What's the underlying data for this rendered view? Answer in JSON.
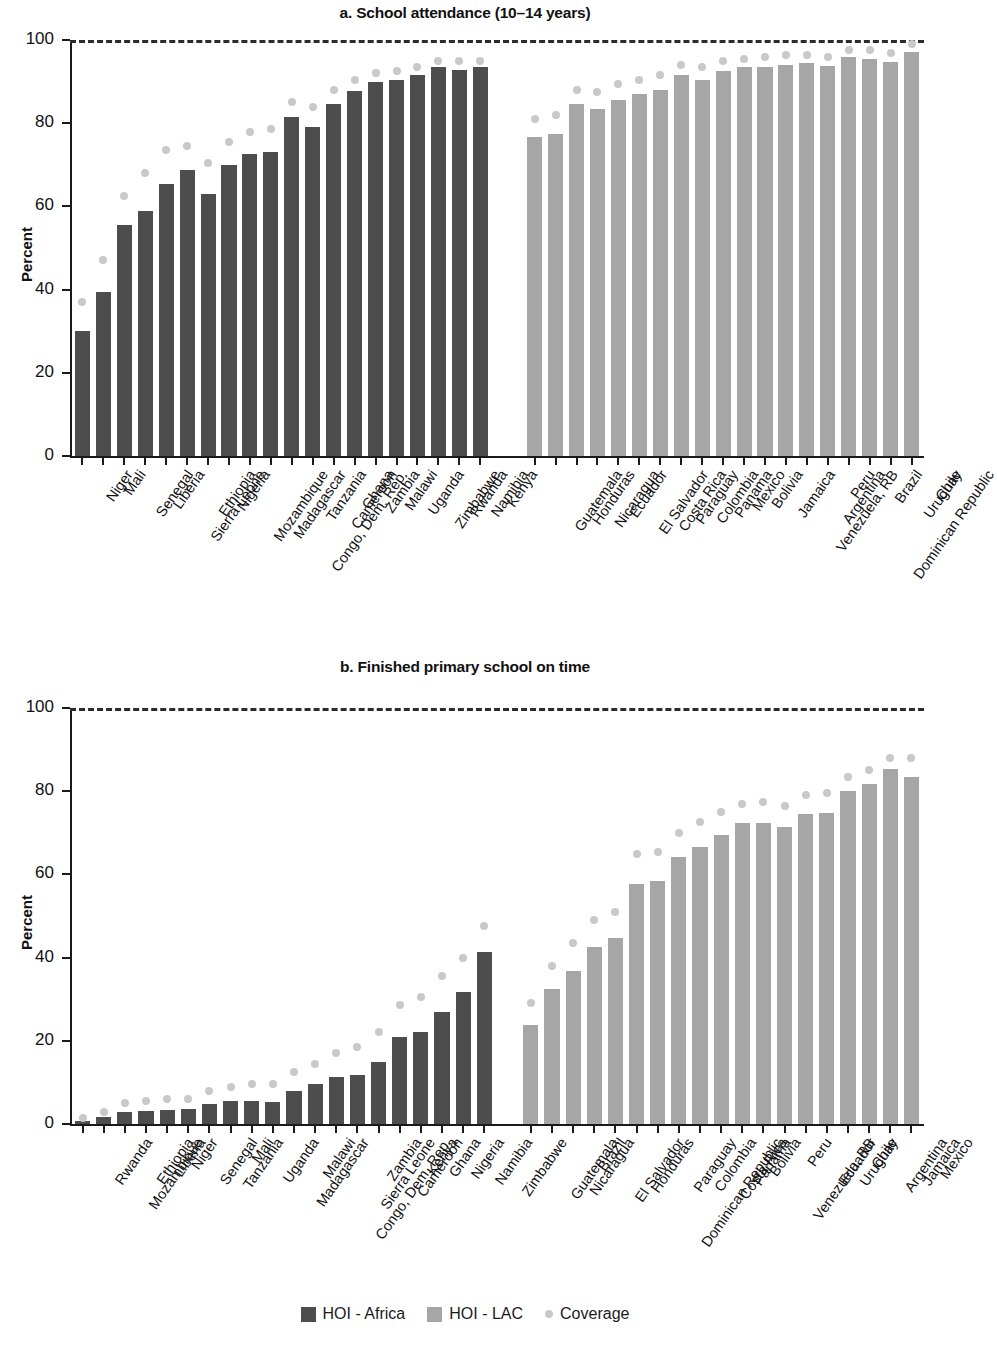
{
  "figure": {
    "ylabel": "Percent",
    "legend": [
      {
        "label": "HOI - Africa",
        "type": "bar",
        "color": "#4d4d4d"
      },
      {
        "label": "HOI - LAC",
        "type": "bar",
        "color": "#a6a6a6"
      },
      {
        "label": "Coverage",
        "type": "dot",
        "color": "#c9c9c9"
      }
    ]
  },
  "chart_data": [
    {
      "type": "bar",
      "id": "a",
      "title": "a. School attendance (10–14 years)",
      "xlabel": "",
      "ylabel": "Percent",
      "ylim": [
        0,
        100
      ],
      "yticks": [
        0,
        20,
        40,
        60,
        80,
        100
      ],
      "grid": false,
      "reference_line": 100,
      "legend_position": "bottom",
      "groups": [
        {
          "name": "HOI - Africa",
          "color": "#4d4d4d",
          "categories": [
            "Niger",
            "Mali",
            "Senegal",
            "Liberia",
            "Sierra Leone",
            "Ethiopia",
            "Nigeria",
            "Mozambique",
            "Madagascar",
            "Congo, Dem. Rep.",
            "Tanzania",
            "Cameroon",
            "Ghana",
            "Zambia",
            "Malawi",
            "Uganda",
            "Zimbabwe",
            "Rwanda",
            "Namibia",
            "Kenya"
          ],
          "hoi": [
            30,
            39.5,
            55.5,
            59,
            65.5,
            68.8,
            63,
            70,
            72.5,
            73,
            81.5,
            79,
            84.5,
            87.8,
            90,
            90.5,
            91.5,
            93.5,
            92.8,
            93.5
          ],
          "coverage": [
            37,
            47,
            62.5,
            68,
            73.5,
            74.5,
            70.5,
            75.5,
            78,
            78.5,
            85,
            84,
            88,
            90.5,
            92,
            92.5,
            93.5,
            95,
            95,
            95
          ]
        },
        {
          "name": "HOI - LAC",
          "color": "#a6a6a6",
          "categories": [
            "Guatemala",
            "Honduras",
            "Nicaragua",
            "Ecuador",
            "El Salvador",
            "Costa Rica",
            "Paraguay",
            "Colombia",
            "Panama",
            "Mexico",
            "Bolivia",
            "Jamaica",
            "Venezuela, RB",
            "Argentina",
            "Peru",
            "Dominican Republic",
            "Brazil",
            "Uruguay",
            "Chile"
          ],
          "hoi": [
            76.8,
            77.5,
            84.5,
            83.5,
            85.5,
            87,
            88,
            91.5,
            90.5,
            92.5,
            93.5,
            93.5,
            94,
            94.5,
            93.8,
            95.8,
            95.5,
            94.8,
            97
          ],
          "coverage": [
            81,
            82,
            88,
            87.5,
            89.5,
            90.5,
            91.5,
            94,
            93.5,
            95,
            95.5,
            96,
            96.5,
            96.5,
            96,
            97.5,
            97.5,
            96.8,
            99
          ]
        }
      ]
    },
    {
      "type": "bar",
      "id": "b",
      "title": "b. Finished primary school on time",
      "xlabel": "",
      "ylabel": "Percent",
      "ylim": [
        0,
        100
      ],
      "yticks": [
        0,
        20,
        40,
        60,
        80,
        100
      ],
      "grid": false,
      "reference_line": 100,
      "legend_position": "bottom",
      "groups": [
        {
          "name": "HOI - Africa",
          "color": "#4d4d4d",
          "categories": [
            "Rwanda",
            "Mozambique",
            "Ethiopia",
            "Liberia",
            "Niger",
            "Senegal",
            "Tanzania",
            "Mali",
            "Uganda",
            "Madagascar",
            "Malawi",
            "Congo, Dem. Rep.",
            "Sierra Leone",
            "Zambia",
            "Cameroon",
            "Kenya",
            "Ghana",
            "Nigeria",
            "Namibia",
            "Zimbabwe"
          ],
          "hoi": [
            0.8,
            1.6,
            3,
            3.2,
            3.3,
            3.5,
            4.8,
            5.5,
            5.5,
            5.3,
            8,
            9.5,
            11.3,
            11.8,
            14.8,
            21,
            22,
            27,
            31.8,
            41.3
          ],
          "coverage": [
            1.5,
            3,
            5,
            5.5,
            6,
            6,
            8,
            9,
            9.5,
            9.5,
            12.5,
            14.5,
            17,
            18.5,
            22,
            28.5,
            30.5,
            35.5,
            40,
            47.5
          ]
        },
        {
          "name": "HOI - LAC",
          "color": "#a6a6a6",
          "categories": [
            "Guatemala",
            "Nicaragua",
            "Brazil",
            "El Salvador",
            "Honduras",
            "Dominican Republic",
            "Paraguay",
            "Colombia",
            "Costa Rica",
            "Panama",
            "Bolivia",
            "Venezuela, RB",
            "Peru",
            "Ecuador",
            "Uruguay",
            "Chile",
            "Argentina",
            "Jamaica",
            "Mexico"
          ],
          "hoi": [
            23.8,
            32.5,
            36.8,
            42.5,
            44.8,
            57.8,
            58.5,
            64.3,
            66.5,
            69.5,
            72.3,
            72.3,
            71.3,
            74.5,
            74.8,
            80,
            81.8,
            85.3,
            83.5
          ],
          "coverage": [
            29,
            38,
            43.5,
            49,
            51,
            65,
            65.5,
            70,
            72.5,
            75,
            77,
            77.5,
            76.5,
            79,
            79.5,
            83.5,
            85,
            88,
            88
          ]
        }
      ]
    }
  ]
}
